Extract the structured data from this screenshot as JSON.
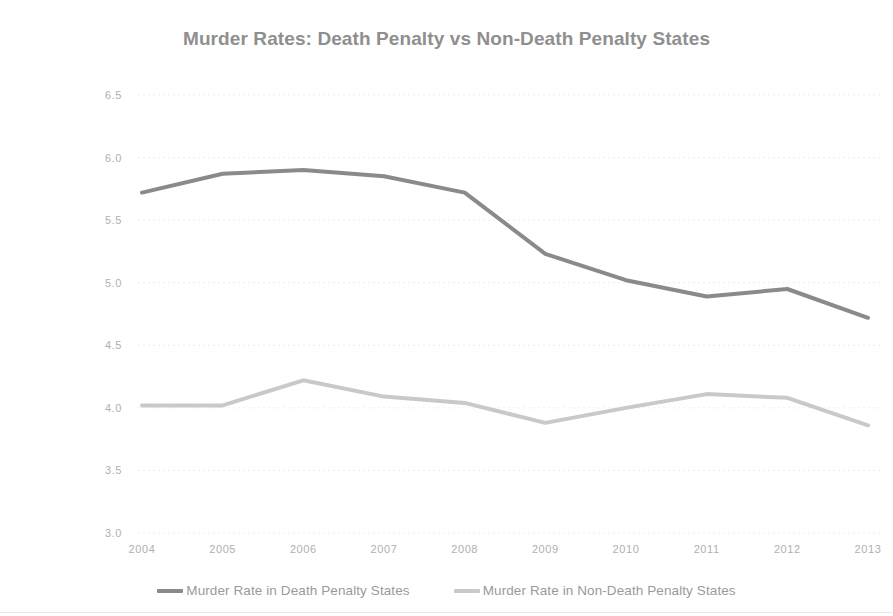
{
  "chart_data": {
    "type": "line",
    "title": "Murder Rates: Death Penalty vs Non-Death Penalty States",
    "xlabel": "",
    "ylabel": "Murder Rate per 100,000",
    "categories": [
      "2004",
      "2005",
      "2006",
      "2007",
      "2008",
      "2009",
      "2010",
      "2011",
      "2012",
      "2013"
    ],
    "x": [
      2004,
      2005,
      2006,
      2007,
      2008,
      2009,
      2010,
      2011,
      2012,
      2013
    ],
    "ylim": [
      3.0,
      6.5
    ],
    "yticks": [
      "6.5",
      "6.0",
      "5.5",
      "5.0",
      "4.5",
      "4.0",
      "3.5",
      "3.0"
    ],
    "ytick_values": [
      6.5,
      6.0,
      5.5,
      5.0,
      4.5,
      4.0,
      3.5,
      3.0
    ],
    "grid": true,
    "legend_position": "bottom",
    "series": [
      {
        "name": "Murder Rate in Death Penalty States",
        "color": "#8a8a8a",
        "values": [
          5.72,
          5.87,
          5.9,
          5.85,
          5.72,
          5.23,
          5.02,
          4.89,
          4.95,
          4.72
        ]
      },
      {
        "name": "Murder Rate in Non-Death Penalty States",
        "color": "#c9c9c9",
        "values": [
          4.02,
          4.02,
          4.22,
          4.09,
          4.04,
          3.88,
          4.0,
          4.11,
          4.08,
          3.86
        ]
      }
    ]
  },
  "legend": {
    "entries": [
      {
        "label": "Murder Rate in Death Penalty States"
      },
      {
        "label": "Murder Rate in Non-Death Penalty States"
      }
    ]
  }
}
